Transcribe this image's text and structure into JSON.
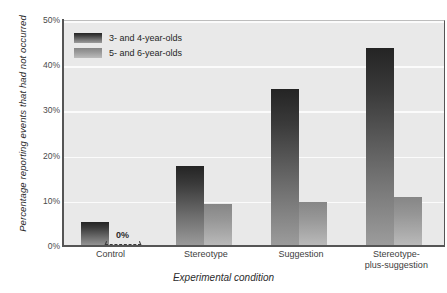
{
  "chart_data": {
    "type": "bar",
    "title": "",
    "xlabel": "Experimental condition",
    "ylabel": "Percentage reporting events that had not occurred",
    "categories": [
      "Control",
      "Stereotype",
      "Suggestion",
      "Stereotype-plus-suggestion"
    ],
    "category_lines": [
      [
        "Control"
      ],
      [
        "Stereotype"
      ],
      [
        "Suggestion"
      ],
      [
        "Stereotype-",
        "plus-suggestion"
      ]
    ],
    "series": [
      {
        "name": "3- and 4-year-olds",
        "values": [
          5.5,
          18,
          35,
          44
        ]
      },
      {
        "name": "5- and 6-year-olds",
        "values": [
          0,
          9.5,
          10,
          11
        ]
      }
    ],
    "ylim": [
      0,
      50
    ],
    "yticks": [
      0,
      10,
      20,
      30,
      40,
      50
    ],
    "ytick_labels": [
      "0%",
      "10%",
      "20%",
      "30%",
      "40%",
      "50%"
    ],
    "grid": true,
    "legend_position": "top-left",
    "annotations": [
      {
        "text": "0%",
        "category": "Control",
        "series": "5- and 6-year-olds",
        "value": 0
      }
    ],
    "colors": {
      "series_1_top": "#242424",
      "series_1_bottom": "#9d9d9d",
      "series_2_top": "#868686",
      "series_2_bottom": "#bcbcbc",
      "plot_background": "#e9e9e9",
      "gridline": "#fbfbfb",
      "axis": "#555555"
    }
  }
}
